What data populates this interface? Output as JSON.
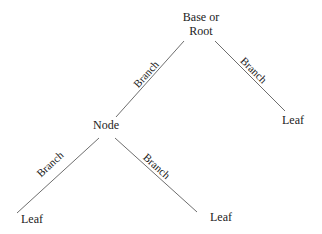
{
  "diagram": {
    "line_color": "#6e6e6e",
    "nodes": {
      "root": {
        "line1": "Base or",
        "line2": "Root"
      },
      "node": {
        "label": "Node"
      },
      "leaf_right": {
        "label": "Leaf"
      },
      "leaf_bottom_left": {
        "label": "Leaf"
      },
      "leaf_bottom_right": {
        "label": "Leaf"
      }
    },
    "branches": [
      {
        "from": "root",
        "to": "node",
        "label": "Branch"
      },
      {
        "from": "root",
        "to": "leaf_right",
        "label": "Branch"
      },
      {
        "from": "node",
        "to": "leaf_bottom_left",
        "label": "Branch"
      },
      {
        "from": "node",
        "to": "leaf_bottom_right",
        "label": "Branch"
      }
    ]
  }
}
